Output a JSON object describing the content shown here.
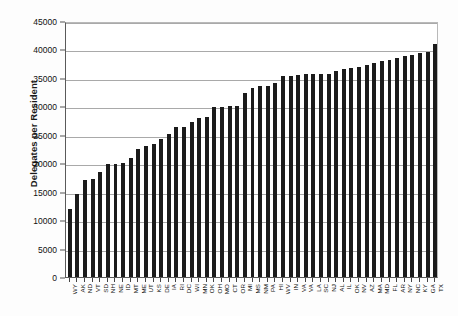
{
  "chart_data": {
    "type": "bar",
    "title": "",
    "xlabel": "",
    "ylabel": "Delegates per Resident",
    "ylim": [
      0,
      45000
    ],
    "ytick_values": [
      0,
      5000,
      10000,
      15000,
      20000,
      25000,
      30000,
      35000,
      40000,
      45000
    ],
    "ytick_labels": [
      "0",
      "5000",
      "10000",
      "15000",
      "20000",
      "25000",
      "30000",
      "35000",
      "40000",
      "45000"
    ],
    "grid": true,
    "legend": false,
    "bar_color": "#1b1b1b",
    "categories": [
      "WY",
      "AK",
      "ND",
      "VT",
      "SD",
      "NH",
      "NE",
      "ID",
      "MT",
      "ME",
      "UT",
      "KS",
      "DE",
      "IA",
      "RI",
      "DC",
      "WI",
      "MN",
      "OK",
      "OH",
      "MO",
      "CT",
      "OR",
      "MI",
      "MS",
      "NM",
      "PA",
      "HI",
      "WV",
      "IN",
      "VA",
      "VA",
      "LA",
      "SC",
      "NJ",
      "AL",
      "IL",
      "OK",
      "NV",
      "AZ",
      "MA",
      "MD",
      "FL",
      "AR",
      "NY",
      "NC",
      "KY",
      "GA",
      "TX"
    ],
    "values": [
      12000,
      14600,
      17100,
      17200,
      18400,
      19900,
      19900,
      20000,
      20900,
      22500,
      23100,
      23300,
      24200,
      25200,
      26300,
      26400,
      27200,
      28000,
      28200,
      29900,
      29900,
      30000,
      30000,
      32400,
      33300,
      33600,
      33600,
      34100,
      35400,
      35400,
      35500,
      35600,
      35700,
      35700,
      35700,
      36300,
      36500,
      36700,
      37000,
      37300,
      37700,
      37900,
      38200,
      38500,
      38800,
      39000,
      39300,
      39600,
      41000
    ]
  }
}
